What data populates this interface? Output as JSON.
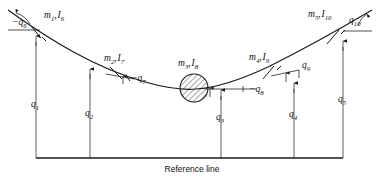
{
  "figure": {
    "type": "mechanical-schematic",
    "reference_line_label": "Reference line"
  },
  "masses": [
    {
      "id": "m1",
      "label": "m₁, I₆",
      "name": "m",
      "name_sub": "1",
      "inertia": "I",
      "inertia_sub": "6",
      "x": 36,
      "y": 32
    },
    {
      "id": "m2",
      "label": "m₂, I₇",
      "name": "m",
      "name_sub": "2",
      "inertia": "I",
      "inertia_sub": "7",
      "x": 117,
      "y": 73
    },
    {
      "id": "m3",
      "label": "m₃, I₈",
      "name": "m",
      "name_sub": "3",
      "inertia": "I",
      "inertia_sub": "8",
      "x": 194,
      "y": 88
    },
    {
      "id": "m4",
      "label": "m₄, I₉",
      "name": "m",
      "name_sub": "4",
      "inertia": "I",
      "inertia_sub": "9",
      "x": 268,
      "y": 72
    },
    {
      "id": "m5",
      "label": "m₅, I₁₀",
      "name": "m",
      "name_sub": "5",
      "inertia": "I",
      "inertia_sub": "10",
      "x": 333,
      "y": 36
    }
  ],
  "translational_coordinates": [
    {
      "id": "q1",
      "name": "q",
      "sub": "1",
      "label": "q₁",
      "x": 36,
      "label_x": 33,
      "label_y": 104,
      "top_y": 34,
      "bottom_y": 158
    },
    {
      "id": "q2",
      "name": "q",
      "sub": "2",
      "label": "q₂",
      "x": 90,
      "label_x": 87,
      "label_y": 113,
      "top_y": 67,
      "bottom_y": 158
    },
    {
      "id": "q3",
      "name": "q",
      "sub": "3",
      "label": "q₃",
      "x": 221,
      "label_x": 218,
      "label_y": 117,
      "top_y": 90,
      "bottom_y": 158
    },
    {
      "id": "q4",
      "name": "q",
      "sub": "4",
      "label": "q₄",
      "x": 294,
      "label_x": 291,
      "label_y": 114,
      "top_y": 83,
      "bottom_y": 158
    },
    {
      "id": "q5",
      "name": "q",
      "sub": "5",
      "label": "q₅",
      "x": 343,
      "label_x": 340,
      "label_y": 99,
      "top_y": 40,
      "bottom_y": 158
    }
  ],
  "rotational_coordinates": [
    {
      "id": "q6",
      "name": "q",
      "sub": "6",
      "label": "−q₆",
      "sign": "−",
      "label_x": 14,
      "label_y": 25,
      "vertex_x": 8,
      "vertex_y": 30
    },
    {
      "id": "q7",
      "name": "q",
      "sub": "7",
      "label": "−q₇",
      "sign": "−",
      "label_x": 133,
      "label_y": 80,
      "vertex_x": 106,
      "vertex_y": 74
    },
    {
      "id": "q8",
      "name": "q",
      "sub": "8",
      "label": "−q₈",
      "sign": "−",
      "label_x": 251,
      "label_y": 92,
      "vertex_x": 208,
      "vertex_y": 89
    },
    {
      "id": "q9",
      "name": "q",
      "sub": "9",
      "label": "q₉",
      "sign": "",
      "label_x": 299,
      "label_y": 67,
      "vertex_x": 271,
      "vertex_y": 76
    },
    {
      "id": "q10",
      "name": "q",
      "sub": "10",
      "label": "q₁₀",
      "sign": "",
      "label_x": 352,
      "label_y": 22,
      "vertex_x": 345,
      "vertex_y": 31
    }
  ],
  "geometry": {
    "curve_path": "M 8,10 C 50,40 95,68 145,82 C 170,89 185,90 196,89 C 215,88 240,80 268,67 C 300,51 345,26 372,10",
    "baseline_y": 158,
    "baseline_x_start": 36,
    "baseline_x_end": 343,
    "circle_cx": 194,
    "circle_cy": 88,
    "circle_r": 14
  },
  "colors": {
    "ink": "#1a1a1a",
    "background": "#ffffff"
  }
}
